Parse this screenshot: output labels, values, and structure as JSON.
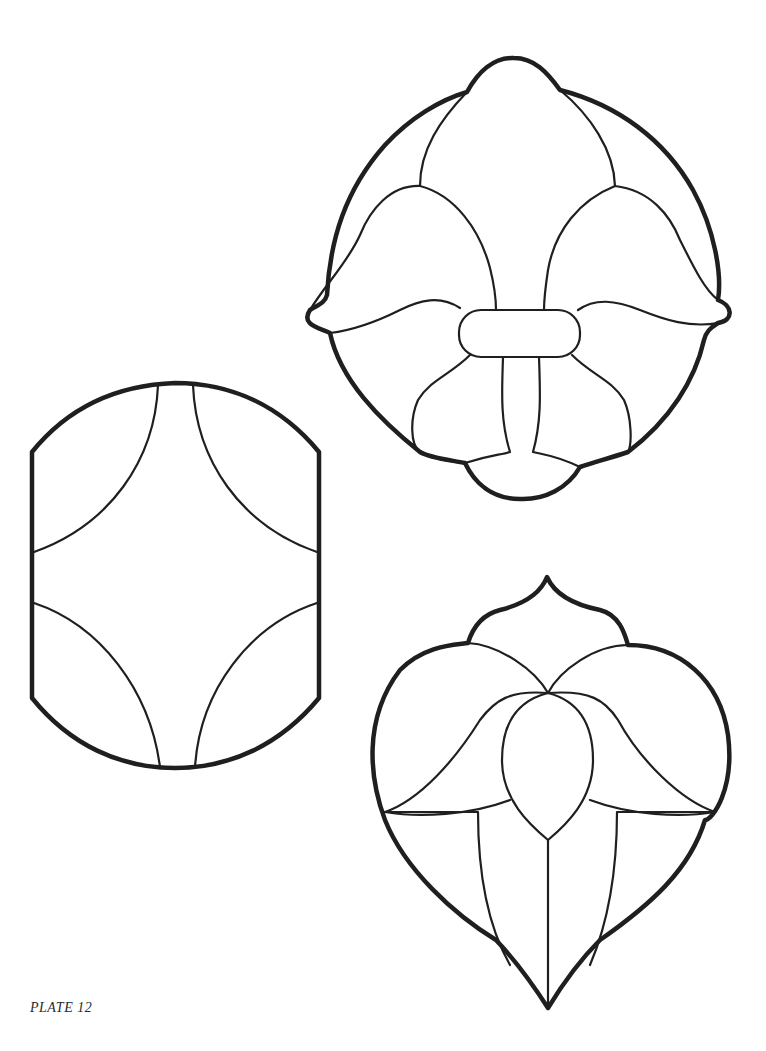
{
  "plate": {
    "label": "PLATE 12"
  },
  "patterns": [
    {
      "id": "fleur-de-lis-medallion",
      "description": "Circular medallion with fleur-de-lis and central band",
      "position": "top-right"
    },
    {
      "id": "rounded-rectangle-quatrefoil",
      "description": "Barrel-shaped panel with four concave arcs",
      "position": "middle-left"
    },
    {
      "id": "heart-lotus",
      "description": "Heart-shaped panel with lotus blossom and ogee top",
      "position": "bottom-right"
    }
  ],
  "colors": {
    "line": "#1f1f1f",
    "background": "#ffffff"
  }
}
